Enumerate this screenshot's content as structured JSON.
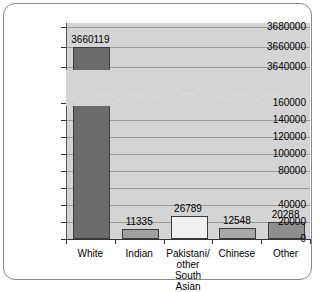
{
  "chart_data": {
    "type": "bar",
    "title": "",
    "subtitle": "",
    "xlabel": "",
    "ylabel": "",
    "categories": [
      "White",
      "Pakistani/\nother South\nAsian",
      "Indian",
      "Chinese",
      "Other"
    ],
    "bars": [
      {
        "category": "White",
        "label_lines": [
          "White"
        ],
        "value": 3660119,
        "value_label": "3660119",
        "color": "#6b6b6b"
      },
      {
        "category": "Indian",
        "label_lines": [
          "Indian"
        ],
        "value": 11335,
        "value_label": "11335",
        "color": "#a0a0a0"
      },
      {
        "category": "Pakistani/other South Asian",
        "label_lines": [
          "Pakistani/",
          "other South",
          "Asian"
        ],
        "value": 26789,
        "value_label": "26789",
        "color": "#f0f0f0"
      },
      {
        "category": "Chinese",
        "label_lines": [
          "Chinese"
        ],
        "value": 12548,
        "value_label": "12548",
        "color": "#a8a8a8"
      },
      {
        "category": "Other",
        "label_lines": [
          "Other"
        ],
        "value": 20288,
        "value_label": "20288",
        "color": "#8e8e8e"
      }
    ],
    "values": [
      3660119,
      11335,
      26789,
      12548,
      20288
    ],
    "broken_axis": true,
    "axis_break_style": "zigzag",
    "lower_segment": {
      "min": 0,
      "max": 170000,
      "tick_labels": [
        "0",
        "20000",
        "40000",
        "60000",
        "80000",
        "100000",
        "120000",
        "140000",
        "160000"
      ],
      "tick_values": [
        0,
        20000,
        40000,
        60000,
        80000,
        100000,
        120000,
        140000,
        160000
      ],
      "hidden_tick_labels": [
        "60000"
      ]
    },
    "upper_segment": {
      "min": 3630000,
      "max": 3684000,
      "tick_labels": [
        "3640000",
        "3660000",
        "3680000"
      ],
      "tick_values": [
        3640000,
        3660000,
        3680000
      ]
    },
    "grid": true,
    "legend": false,
    "legend_position": "none",
    "plot_background": "#d4d4d4",
    "gridline_color": "#9a9a9a",
    "axis_color": "#333333",
    "frame_color": "#8a8a8a",
    "break_band_color": "#ffffff"
  }
}
